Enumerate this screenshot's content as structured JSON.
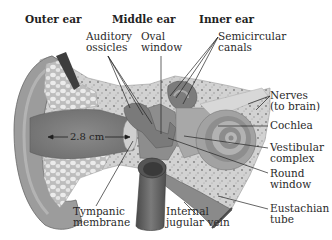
{
  "figure": {
    "sections": [
      {
        "label": "Outer ear"
      },
      {
        "label": "Middle ear"
      },
      {
        "label": "Inner ear"
      }
    ],
    "labels": [
      {
        "id": "auditory-ossicles",
        "text": "Auditory\nossicles"
      },
      {
        "id": "oval-window",
        "text": "Oval\nwindow"
      },
      {
        "id": "semicircular-canals",
        "text": "Semicircular\ncanals"
      },
      {
        "id": "nerves",
        "text": "Nerves\n(to brain)"
      },
      {
        "id": "cochlea",
        "text": "Cochlea"
      },
      {
        "id": "vestibular-complex",
        "text": "Vestibular\ncomplex"
      },
      {
        "id": "round-window",
        "text": "Round\nwindow"
      },
      {
        "id": "eustachian-tube",
        "text": "Eustachian\ntube"
      },
      {
        "id": "internal-jugular-vein",
        "text": "Internal\njugular vein"
      },
      {
        "id": "tympanic-membrane",
        "text": "Tympanic\nmembrane"
      }
    ],
    "measurement": {
      "text": "2.8 cm"
    },
    "colors": {
      "skin": "#9a9a9a",
      "skin_dark": "#7a7a7a",
      "canal": "#8c8c8c",
      "bone": "#d6d6d6",
      "bone_speckle": "#8a8a8a",
      "fat": "#e6e6e6",
      "cochlea_light": "#b8b8b8",
      "cochlea_dark": "#8e8e8e",
      "vein": "#5c5c5c",
      "leader": "#222222"
    }
  }
}
